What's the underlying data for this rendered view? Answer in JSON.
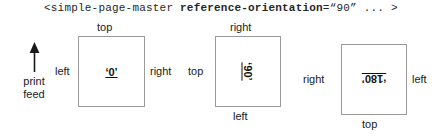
{
  "code_line": {
    "prefix": "<simple-page-master ",
    "attribute_name": "reference-orientation",
    "attribute_value": "=“90”",
    "suffix": " ... >"
  },
  "print_feed": {
    "icon": "up-arrow-icon",
    "line1": "print",
    "line2": "feed"
  },
  "boxes": [
    {
      "id": "box-0",
      "value": "‘0’",
      "rotation": 0,
      "labels": {
        "top": "top",
        "left": "left",
        "right": "right",
        "bottom": ""
      }
    },
    {
      "id": "box-90",
      "value": "‘90’",
      "rotation": 90,
      "labels": {
        "top": "right",
        "left": "top",
        "right": "",
        "bottom": "left"
      }
    },
    {
      "id": "box-180",
      "value": "‘180’",
      "rotation": 180,
      "labels": {
        "top": "",
        "left": "right",
        "right": "left",
        "bottom": "top"
      }
    }
  ],
  "colors": {
    "text": "#1a1a1a",
    "box_border": "#9a9a9a",
    "background": "#ffffff"
  }
}
